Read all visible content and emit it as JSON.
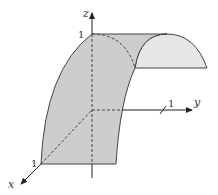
{
  "figure": {
    "axes": {
      "x": {
        "label": "x",
        "tick": "1"
      },
      "y": {
        "label": "y",
        "tick": "1"
      },
      "z": {
        "label": "z",
        "tick": "1"
      }
    },
    "colors": {
      "surface_front": "#cfcfcf",
      "surface_back": "#e8e8e8",
      "stroke": "#333333"
    }
  }
}
